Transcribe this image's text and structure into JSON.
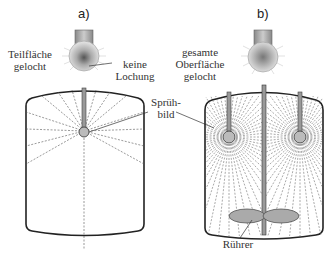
{
  "diagram": {
    "panel_a": {
      "label": "a)",
      "nozzle_caption_left": "Teilfläche\ngelocht",
      "nozzle_caption_right": "keine\nLochung"
    },
    "panel_b": {
      "label": "b)",
      "nozzle_caption": "gesamte\nOberfläche\ngelocht",
      "agitator_label": "Rührer"
    },
    "shared": {
      "spray_pattern_label": "Sprüh-\nbild"
    },
    "colors": {
      "line": "#222222",
      "spray": "#555555",
      "nozzle_fill": "#bbbbbb",
      "agitator_fill": "#aaaaaa"
    }
  }
}
